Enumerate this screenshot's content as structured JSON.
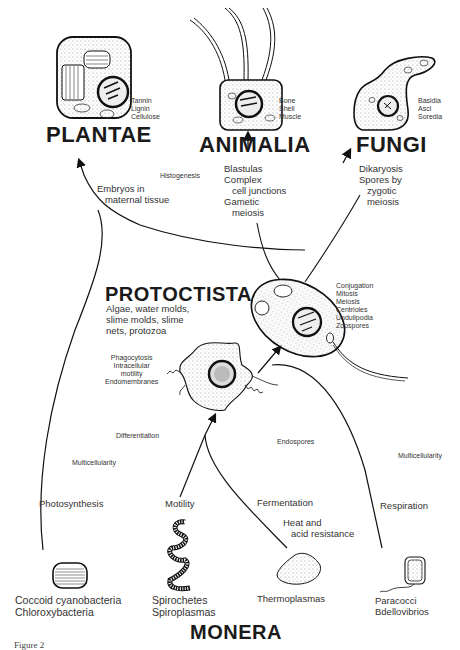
{
  "kingdoms": {
    "plantae": "PLANTAE",
    "animalia": "ANIMALIA",
    "fungi": "FUNGI",
    "protoctista": "PROTOCTISTA",
    "monera": "MONERA"
  },
  "cell_labels": {
    "plantae": "Tannin\nLignin\nCellulose",
    "animalia": "Bone\nShell\nMuscle",
    "fungi": "Basidia\nAsci\nSoredia",
    "protoctista_desc": "Algae, water molds,\nslime molds, slime\nnets, protozoa",
    "protoctista_cell": "Conjugation\nMitosis\nMeiosis\nCentrioles\nUndulipodia\nZoospores",
    "amoeboid": "Phagocytosis\nIntracellular\nmotility\nEndomembranes"
  },
  "branch_labels": {
    "histogenesis": "Histogenesis",
    "embryos": "Embryos in\n   maternal tissue",
    "animal_traits": "Blastulas\nComplex\n   cell junctions\nGametic\n   meiosis",
    "fungi_traits": "Dikaryosis\nSpores by\n   zygotic\n   meiosis",
    "differentiation": "Differentiation",
    "multicellularity_left": "Multicellularity",
    "endospores": "Endospores",
    "multicellularity_right": "Multicellularity",
    "photosynthesis": "Photosynthesis",
    "motility": "Motility",
    "fermentation": "Fermentation",
    "heat_acid": "Heat and\n   acid resistance",
    "respiration": "Respiration"
  },
  "monera_groups": {
    "coccoid": "Coccoid cyanobacteria\nChloroxybacteria",
    "spirochetes": "Spirochetes\nSpiroplasmas",
    "thermoplasmas": "Thermoplasmas",
    "paracocci": "Paracocci\nBdellovibrios"
  },
  "caption": "Figure 2"
}
